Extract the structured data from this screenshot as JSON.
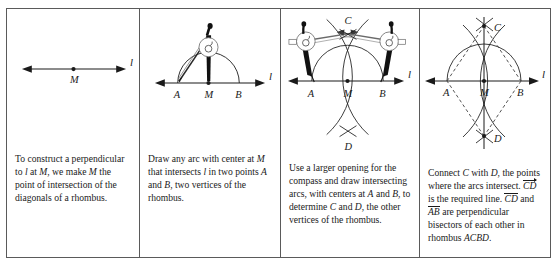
{
  "figure": {
    "title_semantic": "construct-perpendicular-to-line-at-point-using-rhombus",
    "panel_count": 4,
    "colors": {
      "ink": "#1a1a1a",
      "border": "#5a5a5a",
      "background": "#ffffff",
      "compass_leg": "#111111",
      "dashed": "#4a4a4a"
    }
  },
  "panels": [
    {
      "step": "1",
      "caption": "To construct a perpendicular to ℓ at M, we make M the point of intersection of the diagonals of a rhombus.",
      "caption_parts": {
        "p1": "To construct a perpendicular",
        "line_label": "l",
        "p2": " at ",
        "m1": "M",
        "p3": ", we make ",
        "m2": "M",
        "p4": " the",
        "p5": "point of intersection of the",
        "p6": "diagonals of a rhombus.",
        "to": "to "
      },
      "labels": {
        "line": "l",
        "point_m": "M"
      },
      "geometry": {
        "line_y": 60,
        "line_x1": 17,
        "line_x2": 118,
        "point_m_x": 67
      }
    },
    {
      "step": "2",
      "caption": "Draw any arc with center at M that intersects ℓ in two points A and B, two vertices of the rhombus.",
      "caption_parts": {
        "l1a": "Draw any arc with center at",
        "l2a": "M",
        "l2b": " that intersects ",
        "l2c": "l",
        "l2d": " in two",
        "l3a": "points ",
        "l3b": "A",
        "l3c": " and ",
        "l3d": "B",
        "l3e": ", two",
        "l4a": "vertices of the rhombus."
      },
      "labels": {
        "line": "l",
        "point_a": "A",
        "point_m": "M",
        "point_b": "B"
      },
      "geometry": {
        "line_y": 74,
        "point_a_x": 38,
        "point_m_x": 69,
        "point_b_x": 100,
        "arc_radius": 31
      }
    },
    {
      "step": "3",
      "caption": "Use a larger opening for the compass and draw intersecting arcs, with centers at A and B, to determine C and D, the other vertices of the rhombus.",
      "caption_parts": {
        "l1a": "Use a larger opening for the",
        "l2a": "compass and draw",
        "l3a": "intersecting arcs, with",
        "l4a": "centers at ",
        "l4b": "A",
        "l4c": " and ",
        "l4d": "B",
        "l4e": ", to",
        "l5a": "determine ",
        "l5b": "C",
        "l5c": " and ",
        "l5d": "D",
        "l5e": ", the",
        "l6a": "other vertices of the",
        "l7a": "rhombus."
      },
      "labels": {
        "line": "l",
        "point_a": "A",
        "point_m": "M",
        "point_b": "B",
        "point_c": "C",
        "point_d": "D"
      },
      "geometry": {
        "line_y": 72,
        "point_a_x": 31,
        "point_m_x": 67,
        "point_b_x": 103,
        "point_c_y": 14,
        "point_d_y": 122
      }
    },
    {
      "step": "4",
      "caption": "Connect C with D, the points where the arcs intersect. CD is the required line. CD and AB are perpendicular bisectors of each other in rhombus ACBD.",
      "caption_parts": {
        "l1a": "Connect ",
        "l1b": "C",
        "l1c": " with ",
        "l1d": "D",
        "l1e": ", the",
        "l2a": "points where the arcs",
        "l3a": "intersect. ",
        "l3b": "CD",
        "l3c": " is the required",
        "l4a": "line. ",
        "l4b": "CD",
        "l4c": " and ",
        "l4d": "AB",
        "l4e": " are",
        "l5a": "perpendicular bisectors of",
        "l6a": "each other in rhombus",
        "l7a": "ACBD",
        "l7b": "."
      },
      "labels": {
        "line": "l",
        "point_a": "A",
        "point_m": "M",
        "point_b": "B",
        "point_c": "C",
        "point_d": "D"
      },
      "geometry": {
        "line_y": 72,
        "point_a_x": 27,
        "point_m_x": 64,
        "point_b_x": 101,
        "point_c_y": 17,
        "point_d_y": 127
      }
    }
  ]
}
